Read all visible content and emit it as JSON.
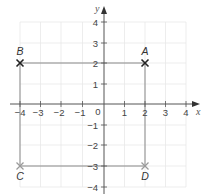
{
  "diagram": {
    "type": "coordinate-grid",
    "axes": {
      "x_label": "x",
      "y_label": "y",
      "x_range": [
        -4,
        4
      ],
      "y_range": [
        -4,
        4
      ],
      "origin_label": "0",
      "x_ticks": [
        "−4",
        "−3",
        "−2",
        "−1",
        "1",
        "2",
        "3",
        "4"
      ],
      "y_ticks": [
        "4",
        "3",
        "2",
        "1",
        "−1",
        "−2",
        "−3",
        "−4"
      ]
    },
    "points": [
      {
        "label": "A",
        "x": 2,
        "y": 2
      },
      {
        "label": "B",
        "x": -4,
        "y": 2
      },
      {
        "label": "C",
        "x": -4,
        "y": -3
      },
      {
        "label": "D",
        "x": 2,
        "y": -3
      }
    ],
    "shape": "rectangle ABDC",
    "colors": {
      "grid": "#e6e6e6",
      "axis": "#555555",
      "rect": "#8a8a8a",
      "cross_dark": "#222222",
      "cross_light": "#9a9a9a"
    }
  }
}
